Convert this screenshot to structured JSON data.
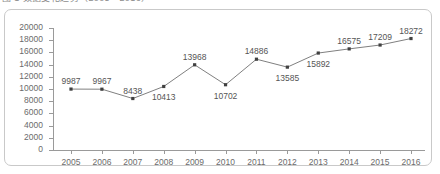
{
  "title": {
    "text": "图 1  数据变化趋势（2005－2016）",
    "visible_note": "cropped"
  },
  "colors": {
    "line": "#808080",
    "marker": "#404040",
    "axis": "#9a9a9a",
    "label_text": "#555555",
    "tick_text": "#6b6b6b",
    "frame_border": "#c9c9c9",
    "background": "#ffffff"
  },
  "chart_data": {
    "type": "line",
    "title": "",
    "xlabel": "",
    "ylabel": "",
    "categories": [
      "2005",
      "2006",
      "2007",
      "2008",
      "2009",
      "2010",
      "2011",
      "2012",
      "2013",
      "2014",
      "2015",
      "2016"
    ],
    "values": [
      9987,
      9967,
      8438,
      10413,
      13968,
      10702,
      14886,
      13585,
      15892,
      16575,
      17209,
      18272
    ],
    "data_labels": [
      "9987",
      "9967",
      "8438",
      "10413",
      "13968",
      "10702",
      "14886",
      "13585",
      "15892",
      "16575",
      "17209",
      "18272"
    ],
    "label_positions": [
      "above",
      "above",
      "above",
      "below",
      "above",
      "below",
      "above",
      "below",
      "below",
      "above",
      "above",
      "above"
    ],
    "ylim": [
      0,
      20000
    ],
    "ytick_values": [
      0,
      2000,
      4000,
      6000,
      8000,
      10000,
      12000,
      14000,
      16000,
      18000,
      20000
    ],
    "ytick_labels": [
      "0",
      "2000",
      "4000",
      "6000",
      "8000",
      "10000",
      "12000",
      "14000",
      "16000",
      "18000",
      "20000"
    ],
    "grid": false,
    "legend": false,
    "legend_position": "none",
    "marker": "square",
    "series": [
      {
        "name": "",
        "values": [
          9987,
          9967,
          8438,
          10413,
          13968,
          10702,
          14886,
          13585,
          15892,
          16575,
          17209,
          18272
        ]
      }
    ]
  }
}
